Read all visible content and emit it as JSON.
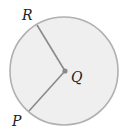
{
  "diagram": {
    "type": "circle-with-radii",
    "circle": {
      "center_label": "Q",
      "fill": "#efefef",
      "stroke": "#a8a8a8"
    },
    "points": [
      {
        "label": "R",
        "position": "on-circle-upper-left"
      },
      {
        "label": "Q",
        "position": "center"
      },
      {
        "label": "P",
        "position": "on-circle-lower-left"
      }
    ],
    "segments": [
      {
        "from": "Q",
        "to": "R"
      },
      {
        "from": "Q",
        "to": "P"
      }
    ],
    "colors": {
      "line": "#8a8a8a",
      "center_dot": "#8a8a8a",
      "text": "#222222"
    }
  }
}
